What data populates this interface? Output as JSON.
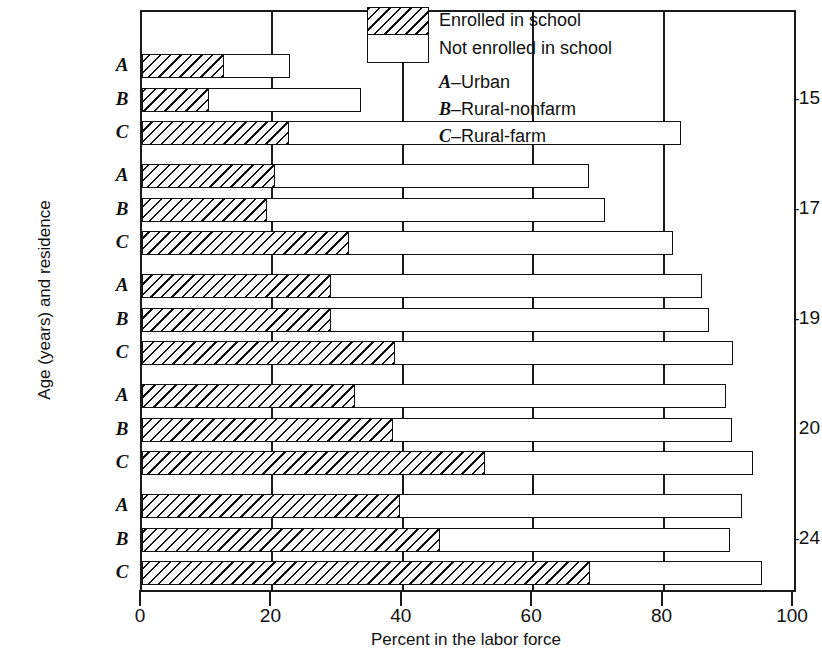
{
  "chart": {
    "type": "bar",
    "orientation": "horizontal-stacked",
    "xlabel": "Percent in the labor force",
    "ylabel": "Age (years) and residence",
    "xlim": [
      0,
      100
    ],
    "xticks": [
      "0",
      "20",
      "40",
      "60",
      "80",
      "100"
    ],
    "grid": "vertical-at-ticks"
  },
  "legend": {
    "position": "top-right-inside",
    "series": [
      {
        "key": "enrolled",
        "label": "Enrolled in school",
        "fill": "diagonal-hatch"
      },
      {
        "key": "not_enrolled",
        "label": "Not enrolled in school",
        "fill": "white"
      }
    ],
    "key_lines": [
      {
        "letter": "A",
        "dash": "–",
        "label": "Urban"
      },
      {
        "letter": "B",
        "dash": "–",
        "label": "Rural-nonfarm"
      },
      {
        "letter": "C",
        "dash": "–",
        "label": "Rural-farm"
      }
    ]
  },
  "chart_data": {
    "type": "bar",
    "title": "",
    "xlabel": "Percent in the labor force",
    "ylabel": "Age (years) and residence",
    "xlim": [
      0,
      100
    ],
    "xticks": [
      0,
      20,
      40,
      60,
      80,
      100
    ],
    "grid": true,
    "legend_position": "top-right",
    "series": [
      {
        "name": "Enrolled in school",
        "key": "enrolled"
      },
      {
        "name": "Not enrolled in school",
        "key": "not_enrolled"
      }
    ],
    "groups": [
      {
        "group": "14–15",
        "rows": [
          {
            "code": "A",
            "residence": "Urban",
            "enrolled": 12.5,
            "not_enrolled": 10.2,
            "total": 22.7
          },
          {
            "code": "B",
            "residence": "Rural-nonfarm",
            "enrolled": 10.3,
            "not_enrolled": 23.3,
            "total": 33.6
          },
          {
            "code": "C",
            "residence": "Rural-farm",
            "enrolled": 22.6,
            "not_enrolled": 60.0,
            "total": 82.6
          }
        ]
      },
      {
        "group": "16–17",
        "rows": [
          {
            "code": "A",
            "residence": "Urban",
            "enrolled": 20.4,
            "not_enrolled": 48.2,
            "total": 68.6
          },
          {
            "code": "B",
            "residence": "Rural-nonfarm",
            "enrolled": 19.2,
            "not_enrolled": 51.8,
            "total": 71.0
          },
          {
            "code": "C",
            "residence": "Rural-farm",
            "enrolled": 31.8,
            "not_enrolled": 49.6,
            "total": 81.4
          }
        ]
      },
      {
        "group": "18–19",
        "rows": [
          {
            "code": "A",
            "residence": "Urban",
            "enrolled": 29.0,
            "not_enrolled": 56.9,
            "total": 85.9
          },
          {
            "code": "B",
            "residence": "Rural-nonfarm",
            "enrolled": 29.0,
            "not_enrolled": 57.9,
            "total": 86.9
          },
          {
            "code": "C",
            "residence": "Rural-farm",
            "enrolled": 38.8,
            "not_enrolled": 51.8,
            "total": 90.6
          }
        ]
      },
      {
        "group": "20",
        "rows": [
          {
            "code": "A",
            "residence": "Urban",
            "enrolled": 32.7,
            "not_enrolled": 56.9,
            "total": 89.6
          },
          {
            "code": "B",
            "residence": "Rural-nonfarm",
            "enrolled": 38.5,
            "not_enrolled": 52.0,
            "total": 90.5
          },
          {
            "code": "C",
            "residence": "Rural-farm",
            "enrolled": 52.6,
            "not_enrolled": 41.1,
            "total": 93.7
          }
        ]
      },
      {
        "group": "21–24",
        "rows": [
          {
            "code": "A",
            "residence": "Urban",
            "enrolled": 39.6,
            "not_enrolled": 52.4,
            "total": 92.0
          },
          {
            "code": "B",
            "residence": "Rural-nonfarm",
            "enrolled": 45.7,
            "not_enrolled": 44.5,
            "total": 90.2
          },
          {
            "code": "C",
            "residence": "Rural-farm",
            "enrolled": 68.7,
            "not_enrolled": 26.4,
            "total": 95.1
          }
        ]
      }
    ]
  },
  "colors": {
    "ink": "#111111",
    "paper": "#ffffff"
  }
}
